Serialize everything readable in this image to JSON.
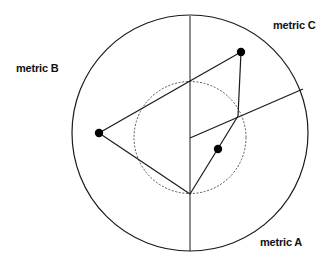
{
  "diagram": {
    "type": "radar-polar-triangle",
    "outer_circle": {
      "cx": 190,
      "cy": 133,
      "r": 118
    },
    "reference_circle": {
      "cx": 190,
      "cy": 137.5,
      "r": 56,
      "style": "dotted"
    },
    "axes": [
      {
        "name": "metric A",
        "from": [
          190,
          16
        ],
        "to": [
          190,
          251
        ]
      },
      {
        "name": "metric C",
        "from": [
          190,
          138
        ],
        "to": [
          303,
          89
        ]
      }
    ],
    "triangle": [
      [
        190,
        81
      ],
      [
        241,
        52
      ],
      [
        190,
        194
      ],
      [
        99,
        133
      ]
    ],
    "inner_polyline": [
      [
        241,
        52
      ],
      [
        238,
        116
      ],
      [
        190,
        194
      ]
    ],
    "points": [
      {
        "label": "metric C",
        "x": 241,
        "y": 52
      },
      {
        "label": "metric B",
        "x": 99,
        "y": 133
      },
      {
        "label": "metric A",
        "x": 218,
        "y": 149
      }
    ],
    "colors": {
      "line": "#1a1a1a",
      "dot": "#000000",
      "dashed": "#444444"
    }
  },
  "labels": {
    "metric_a": "metric A",
    "metric_b": "metric B",
    "metric_c": "metric C"
  }
}
